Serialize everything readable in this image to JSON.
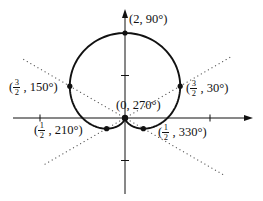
{
  "figure": {
    "background": "#ffffff",
    "ink": "#111111",
    "guide_color": "#555555"
  },
  "chart_data": {
    "type": "line",
    "subtype": "polar-cardioid",
    "equation": "r = 1 + sin(theta)",
    "title": "",
    "xlabel": "",
    "ylabel": "",
    "points": [
      {
        "r": 2,
        "theta_deg": 90,
        "label": "(2, 90°)"
      },
      {
        "r": 1.5,
        "theta_deg": 150,
        "label": "(3/2, 150°)"
      },
      {
        "r": 1.5,
        "theta_deg": 30,
        "label": "(3/2, 30°)"
      },
      {
        "r": 0,
        "theta_deg": 270,
        "label": "(0, 270°)"
      },
      {
        "r": 0.5,
        "theta_deg": 210,
        "label": "(1/2, 210°)"
      },
      {
        "r": 0.5,
        "theta_deg": 330,
        "label": "(1/2, 330°)"
      }
    ],
    "guide_lines": [
      {
        "deg": 30,
        "len_px": 121,
        "back_len_px": 96
      },
      {
        "deg": 150,
        "len_px": 117,
        "back_len_px": 116
      }
    ],
    "axes": {
      "x_ticks_units": [
        -2,
        2
      ],
      "y_ticks_units": [
        -1,
        1
      ],
      "grid": false
    },
    "layout": {
      "origin_px": [
        125,
        118
      ],
      "px_per_unit": 42.5,
      "x_axis_px": [
        13,
        246
      ],
      "y_axis_px": [
        16,
        194
      ],
      "curve_stroke_px": 1.9,
      "dot_radius_px": 2.6,
      "origin_dot_radius_px": 3.2
    }
  },
  "labels": {
    "p90": {
      "text": "(2, 90°)"
    },
    "p150": {
      "open": "(",
      "num": "3",
      "den": "2",
      "rest": " , 150°)"
    },
    "p30": {
      "open": "(",
      "num": "3",
      "den": "2",
      "rest": " , 30°)"
    },
    "p270": {
      "text": "(0, 270°)"
    },
    "p210": {
      "open": "(",
      "num": "1",
      "den": "2",
      "rest": " , 210°)"
    },
    "p330": {
      "open": "(",
      "num": "1",
      "den": "2",
      "rest": " , 330°)"
    }
  }
}
